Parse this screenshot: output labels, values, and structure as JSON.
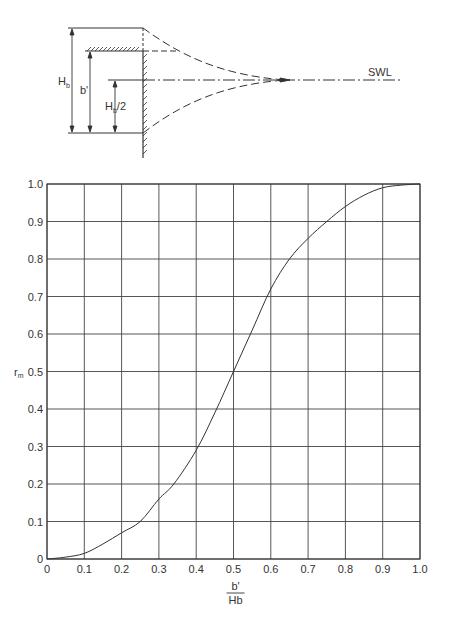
{
  "diagram": {
    "labels": {
      "hb": "H",
      "hb_sub": "b",
      "bprime": "b'",
      "hb_half": "H",
      "hb_half_sub": "b",
      "hb_half_tail": "/2",
      "swl": "SWL"
    }
  },
  "chart_data": {
    "type": "line",
    "title": "",
    "xlabel": "b'/Hb",
    "xlabel_num": "b'",
    "xlabel_den": "Hb",
    "ylabel": "r",
    "ylabel_sub": "m",
    "xlim": [
      0,
      1.0
    ],
    "ylim": [
      0,
      1.0
    ],
    "grid": true,
    "legend": null,
    "x_ticks": [
      "0",
      "0.1",
      "0.2",
      "0.3",
      "0.4",
      "0.5",
      "0.6",
      "0.7",
      "0.8",
      "0.9",
      "1.0"
    ],
    "y_ticks": [
      "0",
      "0.1",
      "0.2",
      "0.3",
      "0.4",
      "0.5",
      "0.6",
      "0.7",
      "0.8",
      "0.9",
      "1.0"
    ],
    "series": [
      {
        "name": "r_m",
        "x": [
          0,
          0.05,
          0.1,
          0.15,
          0.2,
          0.25,
          0.3,
          0.34,
          0.4,
          0.45,
          0.5,
          0.55,
          0.6,
          0.65,
          0.7,
          0.75,
          0.8,
          0.85,
          0.9,
          0.95,
          1.0
        ],
        "y": [
          0,
          0.005,
          0.015,
          0.04,
          0.07,
          0.1,
          0.16,
          0.2,
          0.29,
          0.39,
          0.5,
          0.61,
          0.72,
          0.8,
          0.855,
          0.9,
          0.94,
          0.97,
          0.99,
          0.997,
          1.0
        ]
      }
    ]
  }
}
